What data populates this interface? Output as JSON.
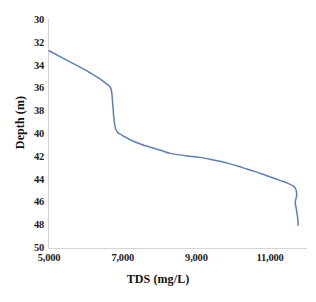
{
  "chart_data": {
    "type": "line",
    "title": "",
    "xlabel": "TDS (mg/L)",
    "ylabel": "Depth (m)",
    "xlim": [
      5000,
      12000
    ],
    "ylim": [
      30,
      50
    ],
    "y_inverted": true,
    "grid": false,
    "legend": null,
    "xticks": [
      5000,
      7000,
      9000,
      11000
    ],
    "xtick_labels": [
      "5,000",
      "7,000",
      "9,000",
      "11,000"
    ],
    "yticks": [
      30,
      32,
      34,
      36,
      38,
      40,
      42,
      44,
      46,
      48,
      50
    ],
    "ytick_labels": [
      "30",
      "32",
      "34",
      "36",
      "38",
      "40",
      "42",
      "44",
      "46",
      "48",
      "50"
    ],
    "series": [
      {
        "name": "TDS profile",
        "color": "#5B7FB8",
        "line_width": 1.5,
        "x": [
          5000,
          5350,
          5700,
          6050,
          6350,
          6560,
          6660,
          6700,
          6720,
          6740,
          6760,
          6790,
          6850,
          6980,
          7200,
          7500,
          7800,
          8050,
          8300,
          8700,
          9100,
          9500,
          9900,
          10250,
          10600,
          10950,
          11250,
          11500,
          11640,
          11700,
          11720,
          11700,
          11680,
          11700,
          11740,
          11760
        ],
        "y": [
          32.7,
          33.3,
          33.9,
          34.5,
          35.1,
          35.6,
          35.9,
          36.3,
          37.0,
          37.8,
          38.6,
          39.3,
          39.8,
          40.1,
          40.5,
          40.9,
          41.2,
          41.45,
          41.7,
          41.9,
          42.05,
          42.3,
          42.6,
          42.95,
          43.3,
          43.7,
          44.05,
          44.35,
          44.6,
          44.9,
          45.3,
          45.7,
          46.0,
          46.4,
          47.2,
          48.0
        ]
      }
    ]
  }
}
